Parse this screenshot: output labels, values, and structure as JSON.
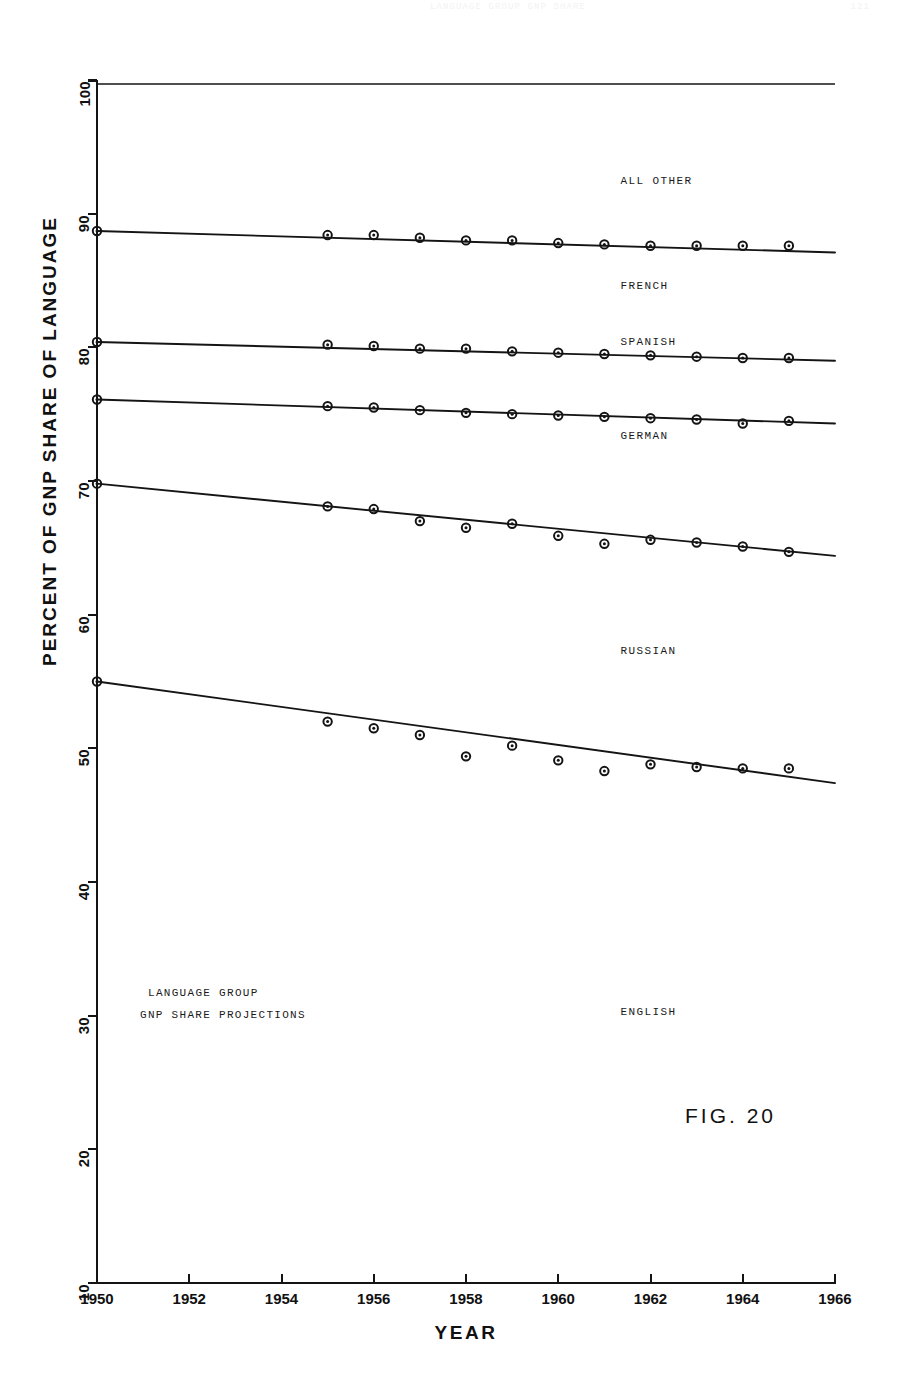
{
  "page_header": {
    "text": "LANGUAGE GROUP GNP SHARE",
    "page_number": "121"
  },
  "figure_label": "FIG. 20",
  "caption": {
    "line1": "LANGUAGE GROUP",
    "line2": "GNP SHARE PROJECTIONS"
  },
  "axes": {
    "y_title": "PERCENT OF GNP SHARE OF LANGUAGE",
    "x_title": "YEAR",
    "y_ticks": [
      "10",
      "20",
      "30",
      "40",
      "50",
      "60",
      "70",
      "80",
      "90",
      "100"
    ],
    "x_ticks": [
      "1950",
      "1952",
      "1954",
      "1956",
      "1958",
      "1960",
      "1962",
      "1964",
      "1966"
    ]
  },
  "colors": {
    "ink": "#141414",
    "paper": "#ffffff",
    "header_faint": "#f2f2f4"
  },
  "chart_data": {
    "type": "line",
    "title": "LANGUAGE GROUP GNP SHARE PROJECTIONS",
    "xlabel": "YEAR",
    "ylabel": "PERCENT OF GNP SHARE OF LANGUAGE",
    "xlim": [
      1950,
      1966
    ],
    "ylim": [
      10,
      100
    ],
    "xticks": [
      1950,
      1952,
      1954,
      1956,
      1958,
      1960,
      1962,
      1964,
      1966
    ],
    "yticks": [
      10,
      20,
      30,
      40,
      50,
      60,
      70,
      80,
      90,
      100
    ],
    "grid": false,
    "legend": "inline-annotations",
    "marker": "circle-open-dot",
    "series": [
      {
        "name": "ALL OTHER",
        "label_position": {
          "x": 1962.0,
          "y": 92.4
        },
        "trend_endpoints": [
          {
            "x": 1950,
            "y": 88.7
          },
          {
            "x": 1966,
            "y": 87.1
          }
        ],
        "x": [
          1950,
          1955,
          1956,
          1957,
          1958,
          1959,
          1960,
          1961,
          1962,
          1963,
          1964,
          1965
        ],
        "y": [
          88.7,
          88.4,
          88.4,
          88.2,
          88.0,
          88.0,
          87.8,
          87.7,
          87.6,
          87.6,
          87.6,
          87.6
        ]
      },
      {
        "name": "FRENCH",
        "label_position": {
          "x": 1962.0,
          "y": 84.5
        },
        "trend_endpoints": [
          {
            "x": 1950,
            "y": 80.4
          },
          {
            "x": 1966,
            "y": 79.0
          }
        ],
        "x": [
          1950,
          1955,
          1956,
          1957,
          1958,
          1959,
          1960,
          1961,
          1962,
          1963,
          1964,
          1965
        ],
        "y": [
          80.4,
          80.2,
          80.1,
          79.9,
          79.9,
          79.7,
          79.6,
          79.5,
          79.4,
          79.3,
          79.2,
          79.2
        ]
      },
      {
        "name": "SPANISH",
        "label_position": {
          "x": 1962.0,
          "y": 80.3
        },
        "trend_endpoints": [
          {
            "x": 1950,
            "y": 76.1
          },
          {
            "x": 1966,
            "y": 74.3
          }
        ],
        "x": [
          1950,
          1955,
          1956,
          1957,
          1958,
          1959,
          1960,
          1961,
          1962,
          1963,
          1964,
          1965
        ],
        "y": [
          76.1,
          75.6,
          75.5,
          75.3,
          75.1,
          75.0,
          74.9,
          74.8,
          74.7,
          74.6,
          74.3,
          74.5
        ]
      },
      {
        "name": "GERMAN",
        "label_position": {
          "x": 1962.0,
          "y": 73.3
        },
        "trend_endpoints": [
          {
            "x": 1950,
            "y": 69.8
          },
          {
            "x": 1966,
            "y": 64.4
          }
        ],
        "x": [
          1950,
          1955,
          1956,
          1957,
          1958,
          1959,
          1960,
          1961,
          1962,
          1963,
          1964,
          1965
        ],
        "y": [
          69.8,
          68.1,
          67.9,
          67.0,
          66.5,
          66.8,
          65.9,
          65.3,
          65.6,
          65.4,
          65.1,
          64.7
        ]
      },
      {
        "name": "RUSSIAN",
        "label_position": {
          "x": 1962.0,
          "y": 57.2
        },
        "trend_endpoints": [
          {
            "x": 1950,
            "y": 55.0
          },
          {
            "x": 1966,
            "y": 47.4
          }
        ],
        "x": [
          1950,
          1955,
          1956,
          1957,
          1958,
          1959,
          1960,
          1961,
          1962,
          1963,
          1964,
          1965
        ],
        "y": [
          55.0,
          52.0,
          51.5,
          51.0,
          49.4,
          50.2,
          49.1,
          48.3,
          48.8,
          48.6,
          48.5,
          48.5
        ]
      },
      {
        "name": "ENGLISH",
        "label_position": {
          "x": 1962.0,
          "y": 30.2
        },
        "trend_endpoints": [],
        "x": [],
        "y": []
      }
    ],
    "reference_line": {
      "name": "100 percent boundary",
      "y": 100,
      "x_start": 1950,
      "x_end": 1966
    }
  }
}
